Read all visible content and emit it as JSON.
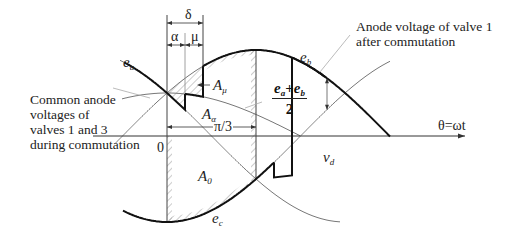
{
  "annotations": {
    "common_anode": [
      "Common anode",
      "voltages of",
      "valves 1 and 3",
      "during commutation"
    ],
    "anode_after": [
      "Anode voltage of valve 1",
      "after commutation"
    ]
  },
  "labels": {
    "delta": "δ",
    "alpha": "α",
    "mu": "μ",
    "pi3": "π/3",
    "origin": "0",
    "theta_axis": "θ=ωt",
    "vd_main": "v",
    "vd_sub": "d",
    "ea_main": "e",
    "ea_sub": "a",
    "eb_main": "e",
    "eb_sub": "b",
    "ec_main": "e",
    "ec_sub": "c",
    "Amu_main": "A",
    "Amu_sub": "μ",
    "Aalpha_main": "A",
    "Aalpha_sub": "α",
    "A0_main": "A",
    "A0_sub": "0",
    "frac_num": "ea+eb",
    "frac_num_e1": "e",
    "frac_num_s1": "a",
    "frac_num_plus": "+",
    "frac_num_e2": "e",
    "frac_num_s2": "b",
    "frac_den": "2"
  },
  "geometry": {
    "axis_y": 136,
    "origin_x": 167,
    "px_per_rad": 85,
    "amplitude": 86,
    "alpha_x": 185,
    "mu_x": 203,
    "pi3_x": 256,
    "vd_x": 327
  },
  "colors": {
    "thick_curve": "#111111",
    "thin_curve": "#777777",
    "hatch": "#9a9a9a"
  }
}
